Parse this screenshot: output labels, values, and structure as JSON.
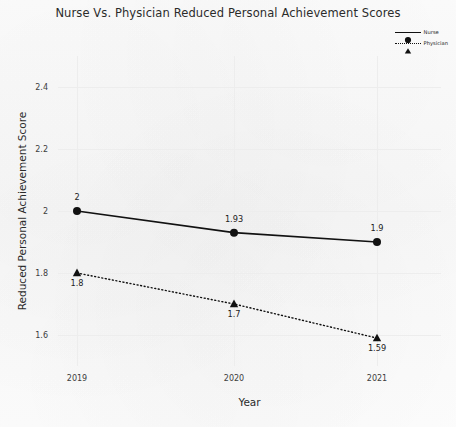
{
  "chart_data": {
    "type": "line",
    "title": "Nurse Vs. Physician Reduced Personal Achievement Scores",
    "xlabel": "Year",
    "ylabel": "Reduced Personal Achievement Score",
    "categories": [
      "2019",
      "2020",
      "2021"
    ],
    "ylim": [
      1.5,
      2.5
    ],
    "yticks": [
      "1.6",
      "1.8",
      "2",
      "2.2",
      "2.4"
    ],
    "ytick_values": [
      1.6,
      1.8,
      2.0,
      2.2,
      2.4
    ],
    "grid": true,
    "legend_position": "top-right",
    "series": [
      {
        "name": "Nurse",
        "values": [
          2,
          1.93,
          1.9
        ],
        "labels": [
          "2",
          "1.93",
          "1.9"
        ],
        "label_position": "above",
        "marker": "circle",
        "linestyle": "solid",
        "color": "#111111"
      },
      {
        "name": "Physician",
        "values": [
          1.8,
          1.7,
          1.59
        ],
        "labels": [
          "1.8",
          "1.7",
          "1.59"
        ],
        "label_position": "below",
        "marker": "triangle",
        "linestyle": "dotted",
        "color": "#111111"
      }
    ]
  },
  "legend": {
    "items": [
      {
        "label": "Nurse",
        "marker": "circle-marker-icon"
      },
      {
        "label": "Physician",
        "marker": "triangle-marker-icon"
      }
    ]
  },
  "colors": {
    "background": "#fcfcfc",
    "ink": "#111111",
    "grid": "#ededed",
    "text": "#2b2b2b"
  }
}
